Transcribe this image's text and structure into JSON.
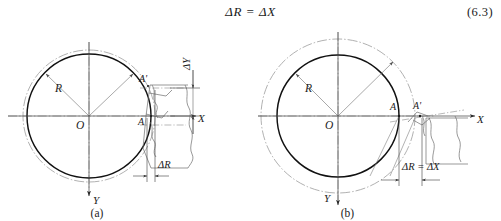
{
  "equation": {
    "text": "ΔR  =  ΔX",
    "number": "(6.3)"
  },
  "figure": {
    "type": "engineering-diagram",
    "panels": [
      {
        "id": "a",
        "caption": "(a)",
        "origin_label": "O",
        "radius_label": "R",
        "axis_x_label": "X",
        "axis_y_label": "Y",
        "point_a": "A",
        "point_a_prime": "A'",
        "dim_radial": "ΔR",
        "dim_vertical": "ΔY",
        "inner_circle_radius": 62,
        "outer_circle_radius": 66
      },
      {
        "id": "b",
        "caption": "(b)",
        "origin_label": "O",
        "radius_label": "R",
        "axis_x_label": "X",
        "axis_y_label": "Y",
        "point_a": "A",
        "point_a_prime": "A'",
        "dim_combined": "ΔR = ΔX",
        "inner_circle_radius": 61,
        "outer_circle_radius": 77
      }
    ]
  },
  "colors": {
    "ink": "#1b1b1b",
    "solid_curve": "#111111",
    "thin_line": "#6d6d6d",
    "centerline": "#8c8c8c",
    "dashdot": "#8a8a8a",
    "background": "#ffffff"
  }
}
